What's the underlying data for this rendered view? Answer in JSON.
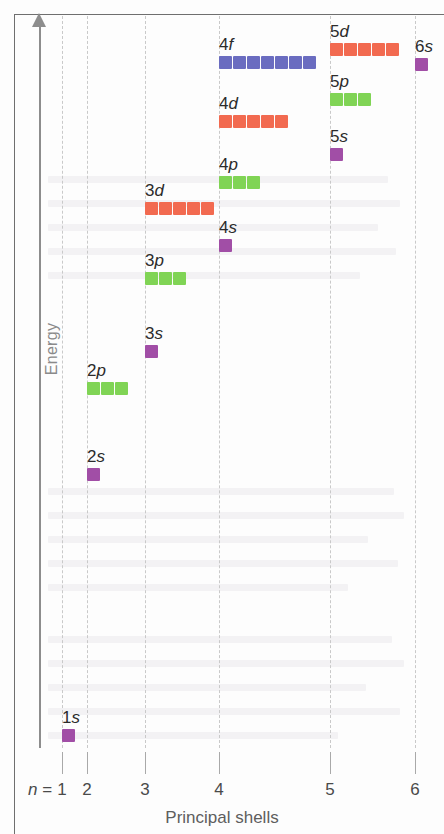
{
  "figure": {
    "y_axis_label": "Energy",
    "x_axis_label": "Principal shells",
    "n_prefix": "n",
    "n_equals": " = "
  },
  "colors": {
    "s_orbital": "#a14ea6",
    "p_orbital": "#80d455",
    "d_orbital": "#f26a50",
    "f_orbital": "#6a6cc0",
    "axis": "#8d8d8d",
    "gridline": "#c9c9c9",
    "text": "#2b2b2b",
    "axis_text": "#8a8a8a"
  },
  "x_axis": {
    "ticks": [
      {
        "label": "1",
        "x": 62
      },
      {
        "label": "2",
        "x": 87
      },
      {
        "label": "3",
        "x": 145
      },
      {
        "label": "4",
        "x": 219
      },
      {
        "label": "5",
        "x": 330
      },
      {
        "label": "6",
        "x": 415
      }
    ]
  },
  "chart_data": {
    "type": "scatter",
    "title": "",
    "xlabel": "Principal shells",
    "ylabel": "Energy",
    "x": [
      1,
      2,
      3,
      4,
      5,
      6
    ],
    "xticklabels": [
      "1",
      "2",
      "3",
      "4",
      "5",
      "6"
    ],
    "grid": "vertical-dashed",
    "legend": "none",
    "note": "Relative energies of atomic orbitals; each square is one orbital (2 electrons).",
    "orbitals": [
      {
        "name": "1s",
        "shell": 1,
        "subshell": "s",
        "boxes": 1,
        "color": "#a14ea6",
        "label": "1s",
        "x": 62,
        "y": 729
      },
      {
        "name": "2s",
        "shell": 2,
        "subshell": "s",
        "boxes": 1,
        "color": "#a14ea6",
        "label": "2s",
        "x": 87,
        "y": 468
      },
      {
        "name": "2p",
        "shell": 2,
        "subshell": "p",
        "boxes": 3,
        "color": "#80d455",
        "label": "2p",
        "x": 87,
        "y": 382
      },
      {
        "name": "3s",
        "shell": 3,
        "subshell": "s",
        "boxes": 1,
        "color": "#a14ea6",
        "label": "3s",
        "x": 145,
        "y": 345
      },
      {
        "name": "3p",
        "shell": 3,
        "subshell": "p",
        "boxes": 3,
        "color": "#80d455",
        "label": "3p",
        "x": 145,
        "y": 272
      },
      {
        "name": "3d",
        "shell": 3,
        "subshell": "d",
        "boxes": 5,
        "color": "#f26a50",
        "label": "3d",
        "x": 145,
        "y": 202
      },
      {
        "name": "4s",
        "shell": 4,
        "subshell": "s",
        "boxes": 1,
        "color": "#a14ea6",
        "label": "4s",
        "x": 219,
        "y": 239
      },
      {
        "name": "4p",
        "shell": 4,
        "subshell": "p",
        "boxes": 3,
        "color": "#80d455",
        "label": "4p",
        "x": 219,
        "y": 176
      },
      {
        "name": "4d",
        "shell": 4,
        "subshell": "d",
        "boxes": 5,
        "color": "#f26a50",
        "label": "4d",
        "x": 219,
        "y": 115
      },
      {
        "name": "4f",
        "shell": 4,
        "subshell": "f",
        "boxes": 7,
        "color": "#6a6cc0",
        "label": "4f",
        "x": 219,
        "y": 56
      },
      {
        "name": "5s",
        "shell": 5,
        "subshell": "s",
        "boxes": 1,
        "color": "#a14ea6",
        "label": "5s",
        "x": 330,
        "y": 148
      },
      {
        "name": "5p",
        "shell": 5,
        "subshell": "p",
        "boxes": 3,
        "color": "#80d455",
        "label": "5p",
        "x": 330,
        "y": 93
      },
      {
        "name": "5d",
        "shell": 5,
        "subshell": "d",
        "boxes": 5,
        "color": "#f26a50",
        "label": "5d",
        "x": 330,
        "y": 43
      },
      {
        "name": "6s",
        "shell": 6,
        "subshell": "s",
        "boxes": 1,
        "color": "#a14ea6",
        "label": "6s",
        "x": 415,
        "y": 58
      }
    ]
  }
}
